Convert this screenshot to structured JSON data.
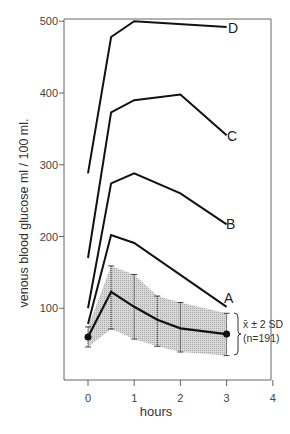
{
  "chart_data": {
    "type": "line",
    "title": "",
    "xlabel": "hours",
    "ylabel": "venous blood glucose  ml / 100 ml.",
    "xlim": [
      0,
      4
    ],
    "ylim": [
      0,
      500
    ],
    "xticks": [
      0,
      1,
      2,
      3,
      4
    ],
    "yticks": [
      100,
      200,
      300,
      400,
      500
    ],
    "grid": false,
    "legend": "inline labels at line ends",
    "series": [
      {
        "name": "D",
        "x": [
          0,
          0.5,
          1,
          3
        ],
        "values": [
          288,
          478,
          500,
          492
        ]
      },
      {
        "name": "C",
        "x": [
          0,
          0.5,
          1,
          2,
          3
        ],
        "values": [
          170,
          373,
          390,
          398,
          341
        ]
      },
      {
        "name": "B",
        "x": [
          0,
          0.5,
          1,
          2,
          3
        ],
        "values": [
          100,
          274,
          288,
          260,
          217
        ]
      },
      {
        "name": "A",
        "x": [
          0,
          0.5,
          1,
          3
        ],
        "values": [
          78,
          202,
          191,
          102
        ]
      }
    ],
    "reference_band": {
      "name": "x̄ ± 2 SD (n=191)",
      "x": [
        0,
        0.5,
        1,
        1.5,
        2,
        3
      ],
      "mean": [
        60,
        123,
        102,
        84,
        72,
        64
      ],
      "upper": [
        74,
        159,
        147,
        117,
        108,
        93
      ],
      "lower": [
        46,
        71,
        57,
        47,
        39,
        34
      ]
    },
    "annotations": [
      "x̄ ± 2 SD",
      "(n=191)"
    ]
  },
  "labels": {
    "xlabel": "hours",
    "ylabel": "venous blood glucose  ml / 100 ml.",
    "band_line1": "x̄ ± 2 SD",
    "band_line2": "(n=191)",
    "xticks": [
      "0",
      "1",
      "2",
      "3",
      "4"
    ],
    "yticks": [
      "100",
      "200",
      "300",
      "400",
      "500"
    ],
    "series": [
      "D",
      "C",
      "B",
      "A"
    ]
  },
  "colors": {
    "line": "#111111",
    "axis": "#555555",
    "band": "#cfcfcf"
  }
}
